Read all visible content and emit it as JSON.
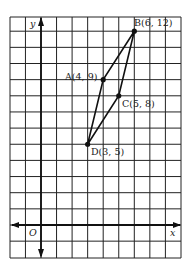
{
  "figure": {
    "axes": {
      "x_label": "x",
      "y_label": "y",
      "origin_label": "O"
    },
    "grid": {
      "x_min": -2,
      "x_max": 9,
      "y_min": -2,
      "y_max": 13
    },
    "points": [
      {
        "name": "A",
        "label": "A(4, 9)",
        "x": 4,
        "y": 9
      },
      {
        "name": "B",
        "label": "B(6, 12)",
        "x": 6,
        "y": 12
      },
      {
        "name": "C",
        "label": "C(5, 8)",
        "x": 5,
        "y": 8
      },
      {
        "name": "D",
        "label": "D(3, 5)",
        "x": 3,
        "y": 5
      }
    ],
    "polygon": [
      "D",
      "A",
      "B",
      "C"
    ]
  },
  "chart_data": {
    "type": "scatter",
    "title": "",
    "xlabel": "x",
    "ylabel": "y",
    "xlim": [
      -2,
      9
    ],
    "ylim": [
      -2,
      13
    ],
    "grid": true,
    "points": [
      {
        "label": "A",
        "x": 4,
        "y": 9
      },
      {
        "label": "B",
        "x": 6,
        "y": 12
      },
      {
        "label": "C",
        "x": 5,
        "y": 8
      },
      {
        "label": "D",
        "x": 3,
        "y": 5
      }
    ],
    "polygon_order": [
      "D",
      "A",
      "B",
      "C"
    ]
  }
}
